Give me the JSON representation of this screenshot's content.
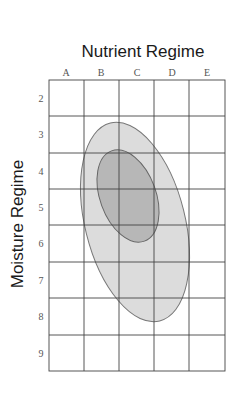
{
  "title": "Nutrient Regime",
  "y_axis_label": "Moisture Regime",
  "columns": [
    "A",
    "B",
    "C",
    "D",
    "E"
  ],
  "rows": [
    "2",
    "3",
    "4",
    "5",
    "6",
    "7",
    "8",
    "9"
  ],
  "regions": [
    {
      "name": "outer-range",
      "fill": "#dcdcdc",
      "stroke": "#777777"
    },
    {
      "name": "inner-optimum",
      "fill": "#b9b9b9",
      "stroke": "#666666"
    }
  ]
}
